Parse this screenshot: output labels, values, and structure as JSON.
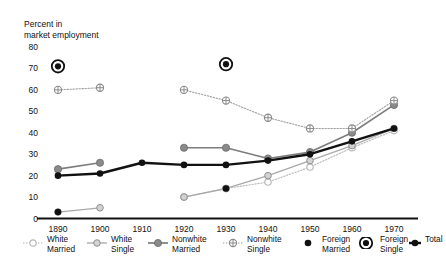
{
  "chart_data": {
    "type": "line",
    "title": "",
    "ylabel": "Percent in\nmarket employment",
    "xlabel": "",
    "ylim": [
      0,
      80
    ],
    "yticks": [
      0,
      10,
      20,
      30,
      40,
      50,
      60,
      70,
      80
    ],
    "x": [
      1890,
      1900,
      1910,
      1920,
      1930,
      1940,
      1950,
      1960,
      1970
    ],
    "grid": false,
    "legend_position": "bottom",
    "series": [
      {
        "name": "White Married",
        "label": "White\nMarried",
        "marker": "open-circle",
        "line": "dotted",
        "color": "#b8b8b8",
        "points": [
          {
            "x": 1890,
            "y": null
          },
          {
            "x": 1900,
            "y": null
          },
          {
            "x": 1910,
            "y": null
          },
          {
            "x": 1920,
            "y": 10
          },
          {
            "x": 1930,
            "y": 14
          },
          {
            "x": 1940,
            "y": 17
          },
          {
            "x": 1950,
            "y": 24
          },
          {
            "x": 1960,
            "y": 33
          },
          {
            "x": 1970,
            "y": 41
          }
        ]
      },
      {
        "name": "White Single",
        "label": "White\nSingle",
        "marker": "grey-circle",
        "line": "solid-thin",
        "color": "#a9a9a9",
        "points": [
          {
            "x": 1890,
            "y": 3
          },
          {
            "x": 1900,
            "y": 5
          },
          {
            "x": 1910,
            "y": null
          },
          {
            "x": 1920,
            "y": 10
          },
          {
            "x": 1930,
            "y": 14
          },
          {
            "x": 1940,
            "y": 20
          },
          {
            "x": 1950,
            "y": 27
          },
          {
            "x": 1960,
            "y": 34
          },
          {
            "x": 1970,
            "y": 42
          }
        ]
      },
      {
        "name": "Nonwhite Married",
        "label": "Nonwhite\nMarried",
        "marker": "filled-grey-circle",
        "line": "solid",
        "color": "#7d7d7d",
        "points": [
          {
            "x": 1890,
            "y": 23
          },
          {
            "x": 1900,
            "y": 26
          },
          {
            "x": 1910,
            "y": null
          },
          {
            "x": 1920,
            "y": 33
          },
          {
            "x": 1930,
            "y": 33
          },
          {
            "x": 1940,
            "y": 28
          },
          {
            "x": 1950,
            "y": 31
          },
          {
            "x": 1960,
            "y": 40
          },
          {
            "x": 1970,
            "y": 53
          }
        ]
      },
      {
        "name": "Nonwhite Single",
        "label": "Nonwhite\nSingle",
        "marker": "crossed-circle",
        "line": "dotted",
        "color": "#a0a0a0",
        "points": [
          {
            "x": 1890,
            "y": 60
          },
          {
            "x": 1900,
            "y": 61
          },
          {
            "x": 1910,
            "y": null
          },
          {
            "x": 1920,
            "y": 60
          },
          {
            "x": 1930,
            "y": 55
          },
          {
            "x": 1940,
            "y": 47
          },
          {
            "x": 1950,
            "y": 42
          },
          {
            "x": 1960,
            "y": 42
          },
          {
            "x": 1970,
            "y": 55
          }
        ]
      },
      {
        "name": "Foreign Married",
        "label": "Foreign\nMarried",
        "marker": "filled-black-circle",
        "line": "none",
        "color": "#111111",
        "points": [
          {
            "x": 1890,
            "y": 3
          },
          {
            "x": 1900,
            "y": null
          },
          {
            "x": 1910,
            "y": null
          },
          {
            "x": 1920,
            "y": null
          },
          {
            "x": 1930,
            "y": 14
          },
          {
            "x": 1940,
            "y": null
          },
          {
            "x": 1950,
            "y": null
          },
          {
            "x": 1960,
            "y": null
          },
          {
            "x": 1970,
            "y": null
          }
        ]
      },
      {
        "name": "Foreign Single",
        "label": "Foreign\nSingle",
        "marker": "bullseye",
        "line": "none",
        "color": "#111111",
        "points": [
          {
            "x": 1890,
            "y": 71
          },
          {
            "x": 1900,
            "y": null
          },
          {
            "x": 1910,
            "y": null
          },
          {
            "x": 1920,
            "y": null
          },
          {
            "x": 1930,
            "y": 72
          },
          {
            "x": 1940,
            "y": null
          },
          {
            "x": 1950,
            "y": null
          },
          {
            "x": 1960,
            "y": null
          },
          {
            "x": 1970,
            "y": null
          }
        ]
      },
      {
        "name": "Total",
        "label": "Total",
        "marker": "filled-black-circle",
        "line": "solid-bold",
        "color": "#111111",
        "points": [
          {
            "x": 1890,
            "y": 20
          },
          {
            "x": 1900,
            "y": 21
          },
          {
            "x": 1910,
            "y": 26
          },
          {
            "x": 1920,
            "y": 25
          },
          {
            "x": 1930,
            "y": 25
          },
          {
            "x": 1940,
            "y": 27
          },
          {
            "x": 1950,
            "y": 30
          },
          {
            "x": 1960,
            "y": 36
          },
          {
            "x": 1970,
            "y": 42
          }
        ]
      }
    ]
  },
  "axes": {
    "y_title_line1": "Percent in",
    "y_title_line2": "market employment",
    "yticks": [
      "80",
      "70",
      "60",
      "50",
      "40",
      "30",
      "20",
      "10",
      "0"
    ],
    "xticks": [
      "1890",
      "1900",
      "1910",
      "1920",
      "1930",
      "1940",
      "1950",
      "1960",
      "1970"
    ]
  },
  "legend": {
    "items": [
      {
        "label": "White\nMarried",
        "name": "white-married"
      },
      {
        "label": "White\nSingle",
        "name": "white-single"
      },
      {
        "label": "Nonwhite\nMarried",
        "name": "nonwhite-married"
      },
      {
        "label": "Nonwhite\nSingle",
        "name": "nonwhite-single"
      },
      {
        "label": "Foreign\nMarried",
        "name": "foreign-married"
      },
      {
        "label": "Foreign\nSingle",
        "name": "foreign-single"
      },
      {
        "label": "Total",
        "name": "total"
      }
    ]
  },
  "colors": {
    "axis": "#111111",
    "grey_light": "#b8b8b8",
    "grey_mid": "#a0a0a0",
    "grey_dark": "#7d7d7d",
    "black": "#111111"
  }
}
